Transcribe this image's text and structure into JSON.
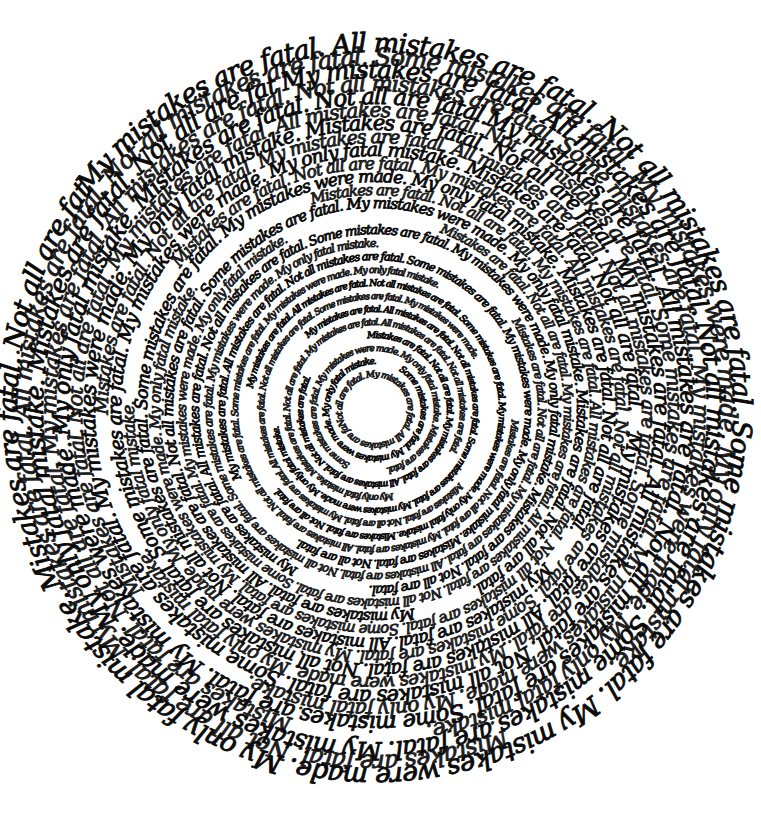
{
  "artwork": {
    "type": "handwritten circular text spiral",
    "background": "#ffffff",
    "ink": "#0a0a0a",
    "center": [
      375,
      410
    ],
    "outer_radius": 372,
    "inner_hole_radius": 30,
    "phrases": [
      "My mistakes are fatal.",
      "All mistakes are fatal.",
      "Not all mistakes are fatal.",
      "Some mistakes are fatal.",
      "My mistakes were made.",
      "My only fatal mistake.",
      "Mistakes are fatal.",
      "Not all are fatal."
    ]
  }
}
